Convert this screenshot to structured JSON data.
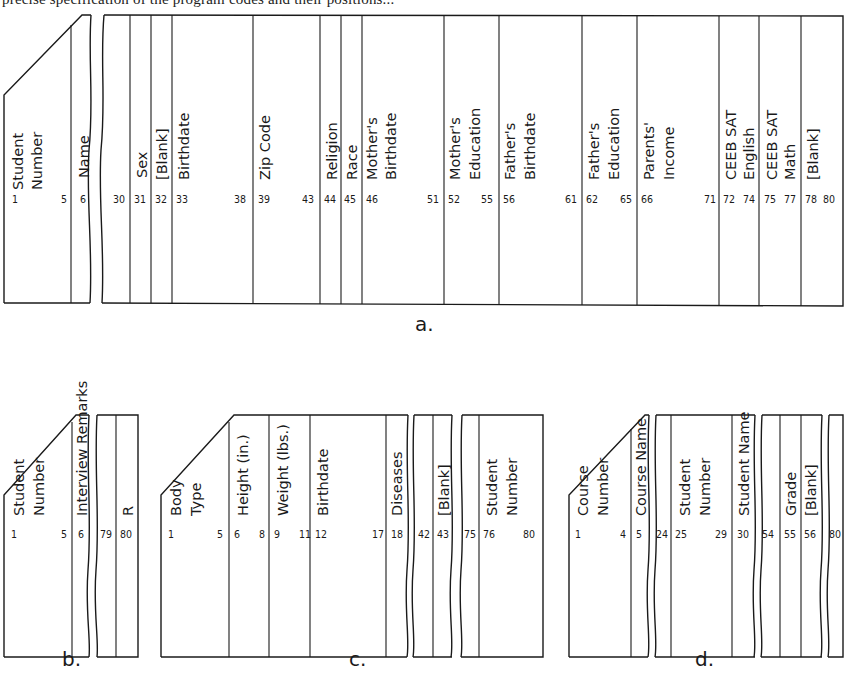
{
  "caption_fragment": "precise specification of the program codes and their positions...",
  "cards": {
    "a": {
      "label": "a.",
      "fields": [
        {
          "name": "Student Number",
          "lines": [
            "Student",
            "Number"
          ],
          "start": "1",
          "end": "5"
        },
        {
          "name": "Name",
          "lines": [
            "Name"
          ],
          "start": "6",
          "end": "30"
        },
        {
          "name": "Sex",
          "lines": [
            "Sex"
          ],
          "start": "31",
          "end": ""
        },
        {
          "name": "[Blank]",
          "lines": [
            "[Blank]"
          ],
          "start": "32",
          "end": ""
        },
        {
          "name": "Birthdate",
          "lines": [
            "Birthdate"
          ],
          "start": "33",
          "end": "38"
        },
        {
          "name": "Zip Code",
          "lines": [
            "Zip Code"
          ],
          "start": "39",
          "end": "43"
        },
        {
          "name": "Religion",
          "lines": [
            "Religion"
          ],
          "start": "44",
          "end": ""
        },
        {
          "name": "Race",
          "lines": [
            "Race"
          ],
          "start": "45",
          "end": ""
        },
        {
          "name": "Mother's Birthdate",
          "lines": [
            "Mother's",
            "Birthdate"
          ],
          "start": "46",
          "end": "51"
        },
        {
          "name": "Mother's Education",
          "lines": [
            "Mother's",
            "Education"
          ],
          "start": "52",
          "end": "55"
        },
        {
          "name": "Father's Birthdate",
          "lines": [
            "Father's",
            "Birthdate"
          ],
          "start": "56",
          "end": "61"
        },
        {
          "name": "Father's Education",
          "lines": [
            "Father's",
            "Education"
          ],
          "start": "62",
          "end": "65"
        },
        {
          "name": "Parents' Income",
          "lines": [
            "Parents'",
            "Income"
          ],
          "start": "66",
          "end": "71"
        },
        {
          "name": "CEEB SAT English",
          "lines": [
            "CEEB SAT",
            "English"
          ],
          "start": "72",
          "end": "74"
        },
        {
          "name": "CEEB SAT Math",
          "lines": [
            "CEEB SAT",
            "Math"
          ],
          "start": "75",
          "end": "77"
        },
        {
          "name": "[Blank]",
          "lines": [
            "[Blank]"
          ],
          "start": "78",
          "end": "80"
        }
      ]
    },
    "b": {
      "label": "b.",
      "fields": [
        {
          "name": "Student Number",
          "lines": [
            "Student",
            "Number"
          ],
          "start": "1",
          "end": "5"
        },
        {
          "name": "Interview Remarks",
          "lines": [
            "Interview Remarks"
          ],
          "start": "6",
          "end": "79"
        },
        {
          "name": "R",
          "lines": [
            "R"
          ],
          "start": "80",
          "end": ""
        }
      ]
    },
    "c": {
      "label": "c.",
      "fields": [
        {
          "name": "Body Type",
          "lines": [
            "Body",
            "Type"
          ],
          "start": "1",
          "end": "5"
        },
        {
          "name": "Height (in.)",
          "lines": [
            "Height (in.)"
          ],
          "start": "6",
          "end": "8"
        },
        {
          "name": "Weight (lbs.)",
          "lines": [
            "Weight (lbs.)"
          ],
          "start": "9",
          "end": "11"
        },
        {
          "name": "Birthdate",
          "lines": [
            "Birthdate"
          ],
          "start": "12",
          "end": "17"
        },
        {
          "name": "Diseases",
          "lines": [
            "Diseases"
          ],
          "start": "18",
          "end": "42"
        },
        {
          "name": "[Blank]",
          "lines": [
            "[Blank]"
          ],
          "start": "43",
          "end": "75"
        },
        {
          "name": "Student Number",
          "lines": [
            "Student",
            "Number"
          ],
          "start": "76",
          "end": "80"
        }
      ]
    },
    "d": {
      "label": "d.",
      "fields": [
        {
          "name": "Course Number",
          "lines": [
            "Course",
            "Number"
          ],
          "start": "1",
          "end": "4"
        },
        {
          "name": "Course Name",
          "lines": [
            "Course Name"
          ],
          "start": "5",
          "end": "24"
        },
        {
          "name": "Student Number",
          "lines": [
            "Student",
            "Number"
          ],
          "start": "25",
          "end": "29"
        },
        {
          "name": "Student Name",
          "lines": [
            "Student Name"
          ],
          "start": "30",
          "end": "54"
        },
        {
          "name": "Grade",
          "lines": [
            "Grade"
          ],
          "start": "55",
          "end": ""
        },
        {
          "name": "[Blank]",
          "lines": [
            "[Blank]"
          ],
          "start": "56",
          "end": "80"
        }
      ]
    }
  },
  "labels": {
    "a_sn_1": "Student",
    "a_sn_2": "Number",
    "a_name": "Name",
    "a_sex": "Sex",
    "a_blank1": "[Blank]",
    "a_birth": "Birthdate",
    "a_zip": "Zip Code",
    "a_rel": "Religion",
    "a_race": "Race",
    "a_mb_1": "Mother's",
    "a_mb_2": "Birthdate",
    "a_me_1": "Mother's",
    "a_me_2": "Education",
    "a_fb_1": "Father's",
    "a_fb_2": "Birthdate",
    "a_fe_1": "Father's",
    "a_fe_2": "Education",
    "a_pi_1": "Parents'",
    "a_pi_2": "Income",
    "a_se_1": "CEEB SAT",
    "a_se_2": "English",
    "a_sm_1": "CEEB SAT",
    "a_sm_2": "Math",
    "a_blank2": "[Blank]",
    "b_sn_1": "Student",
    "b_sn_2": "Number",
    "b_ir": "Interview Remarks",
    "b_r": "R",
    "c_bt_1": "Body",
    "c_bt_2": "Type",
    "c_h": "Height (in.)",
    "c_w": "Weight (lbs.)",
    "c_b": "Birthdate",
    "c_d": "Diseases",
    "c_blank": "[Blank]",
    "c_sn_1": "Student",
    "c_sn_2": "Number",
    "d_cn_1": "Course",
    "d_cn_2": "Number",
    "d_cname": "Course Name",
    "d_sn_1": "Student",
    "d_sn_2": "Number",
    "d_sname": "Student Name",
    "d_grade": "Grade",
    "d_blank": "[Blank]"
  },
  "numbers": {
    "a": [
      "1",
      "5",
      "6",
      "30",
      "31",
      "32",
      "33",
      "38",
      "39",
      "43",
      "44",
      "45",
      "46",
      "51",
      "52",
      "55",
      "56",
      "61",
      "62",
      "65",
      "66",
      "71",
      "72",
      "74",
      "75",
      "77",
      "78",
      "80"
    ],
    "b": [
      "1",
      "5",
      "6",
      "79",
      "80"
    ],
    "c": [
      "1",
      "5",
      "6",
      "8",
      "9",
      "11",
      "12",
      "17",
      "18",
      "42",
      "43",
      "75",
      "76",
      "80"
    ],
    "d": [
      "1",
      "4",
      "5",
      "24",
      "25",
      "29",
      "30",
      "54",
      "55",
      "56",
      "80"
    ]
  }
}
